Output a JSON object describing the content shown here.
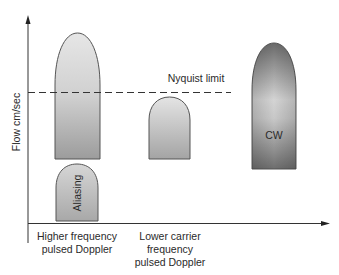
{
  "diagram": {
    "y_axis_label": "Flow cm/sec",
    "nyquist_label": "Nyquist limit",
    "shapes": {
      "aliasing_label": "Aliasing",
      "cw_label": "CW"
    },
    "x_labels": {
      "higher": [
        "Higher frequency",
        "pulsed Doppler"
      ],
      "lower": [
        "Lower carrier",
        "frequency",
        "pulsed Doppler"
      ]
    },
    "colors": {
      "axis": "#333333",
      "shape_outline": "#555555",
      "light_fill": "#e2e2e2",
      "mid_fill": "#9a9a9a",
      "dark_fill": "#6e6e6e"
    }
  }
}
